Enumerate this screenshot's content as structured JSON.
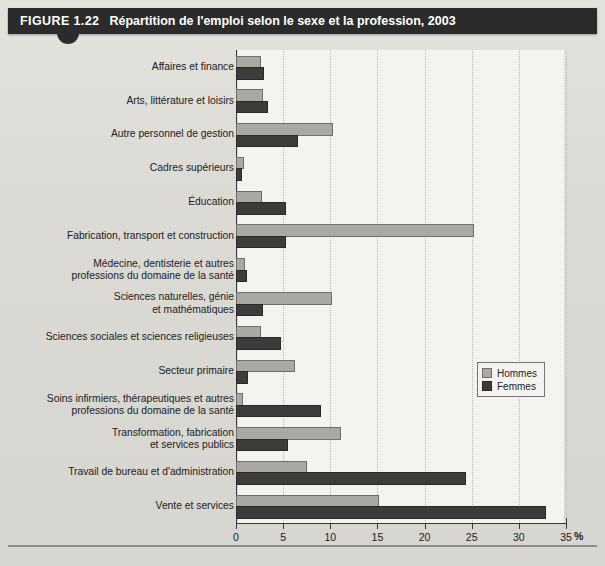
{
  "figure": {
    "number": "FIGURE 1.22",
    "title": "Répartition de l'emploi selon le sexe et la profession, 2003"
  },
  "legend": {
    "items": [
      {
        "label": "Hommes",
        "color": "#a9a8a2"
      },
      {
        "label": "Femmes",
        "color": "#3d3c3a"
      }
    ]
  },
  "axis": {
    "unit": "%",
    "ticks": [
      "0",
      "5",
      "10",
      "15",
      "20",
      "25",
      "30",
      "35"
    ]
  },
  "chart_data": {
    "type": "bar",
    "orientation": "horizontal",
    "title": "Répartition de l'emploi selon le sexe et la profession, 2003",
    "xlabel": "%",
    "ylabel": "",
    "xlim": [
      0,
      35
    ],
    "xticks": [
      0,
      5,
      10,
      15,
      20,
      25,
      30,
      35
    ],
    "grid": true,
    "legend_position": "right-middle",
    "categories": [
      "Affaires et finance",
      "Arts, littérature et loisirs",
      "Autre personnel de gestion",
      "Cadres supérieurs",
      "Éducation",
      "Fabrication, transport et construction",
      "Médecine, dentisterie et autres\nprofessions du domaine de la santé",
      "Sciences naturelles, génie\net mathématiques",
      "Sciences sociales et sciences religieuses",
      "Secteur primaire",
      "Soins infirmiers, thérapeutiques et autres\nprofessions du domaine de la santé",
      "Transformation, fabrication\net services publics",
      "Travail de bureau et d'administration",
      "Vente et services"
    ],
    "series": [
      {
        "name": "Hommes",
        "color": "#a9a8a2",
        "values": [
          2.4,
          2.6,
          10.1,
          0.6,
          2.5,
          25.0,
          0.7,
          10.0,
          2.4,
          6.0,
          0.5,
          10.9,
          7.3,
          15.0
        ]
      },
      {
        "name": "Femmes",
        "color": "#3d3c3a",
        "values": [
          2.8,
          3.2,
          6.4,
          0.4,
          5.1,
          5.1,
          1.0,
          2.6,
          4.6,
          1.1,
          8.8,
          5.3,
          24.2,
          32.7
        ]
      }
    ]
  }
}
